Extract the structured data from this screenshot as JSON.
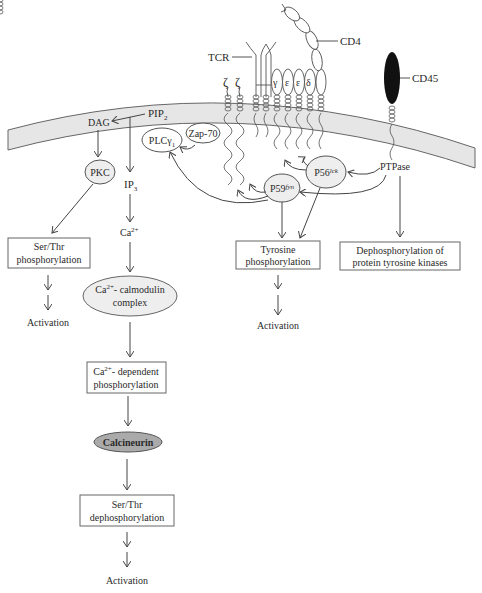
{
  "diagram": {
    "membrane": {
      "fill": "#e8e8e8",
      "stroke": "#555555"
    },
    "receptors": {
      "tcr": "TCR",
      "cd4": "CD4",
      "cd45": "CD45",
      "zeta1": "ζ",
      "zeta2": "ζ",
      "gamma": "γ",
      "epsilon1": "ε",
      "epsilon2": "ε",
      "delta": "δ"
    },
    "molecules": {
      "pip2": "PIP",
      "pip2_sub": "2",
      "dag": "DAG",
      "pkc": "PKC",
      "ip3": "IP",
      "ip3_sub": "3",
      "plcg1": "PLCγ",
      "plcg1_sub": "1",
      "zap70": "Zap-70",
      "p59fyn": "P59",
      "p59fyn_sup": "fyn",
      "p56lck": "P56",
      "p56lck_sup": "lck",
      "ptpase": "PTPase",
      "ca": "Ca",
      "ca_sup": "2+"
    },
    "boxes": {
      "ser_thr_phos_1": "Ser/Thr",
      "ser_thr_phos_2": "phosphorylation",
      "tyr_phos_1": "Tyrosine",
      "tyr_phos_2": "phosphorylation",
      "dephos_ptk_1": "Dephosphorylation of",
      "dephos_ptk_2": "protein tyrosine kinases",
      "ca_calmodulin_1a": "Ca",
      "ca_calmodulin_1sup": "2+",
      "ca_calmodulin_1b": "- calmodulin",
      "ca_calmodulin_2": "complex",
      "ca_dep_1a": "Ca",
      "ca_dep_1sup": "2+",
      "ca_dep_1b": "- dependent",
      "ca_dep_2": "phosphorylation",
      "calcineurin": "Calcineurin",
      "ser_thr_dephos_1": "Ser/Thr",
      "ser_thr_dephos_2": "dephosphorylation"
    },
    "outcomes": {
      "activation_left": "Activation",
      "activation_mid": "Activation",
      "activation_bottom": "Activation"
    }
  }
}
